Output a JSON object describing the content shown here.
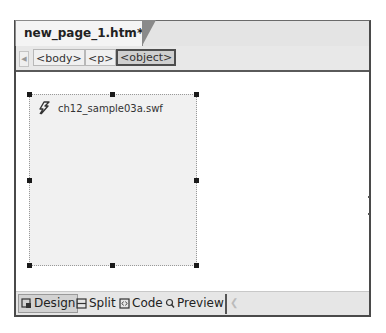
{
  "document": {
    "tab_title": "new_page_1.htm*"
  },
  "tag_selector": {
    "tags": [
      {
        "label": "<body>",
        "active": false
      },
      {
        "label": "<p>",
        "active": false
      },
      {
        "label": "<object>",
        "active": true
      }
    ]
  },
  "design_view": {
    "selected_object": {
      "icon": "flash-icon",
      "filename": "ch12_sample03a.swf"
    }
  },
  "view_tabs": {
    "design": "Design",
    "split": "Split",
    "code": "Code",
    "preview": "Preview",
    "active": "Design"
  }
}
